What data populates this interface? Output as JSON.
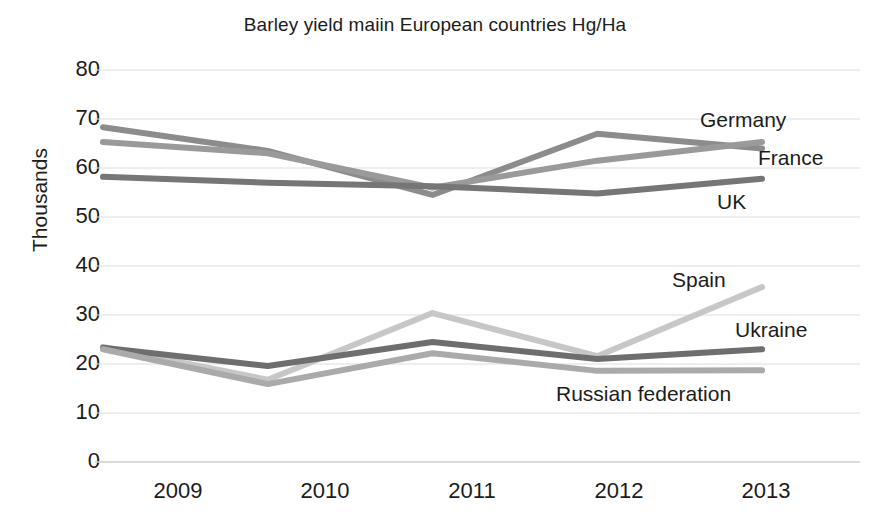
{
  "chart_data": {
    "type": "line",
    "title": "Barley yield maiin European countries Hg/Ha",
    "xlabel": "",
    "ylabel": "Thousands",
    "categories": [
      "2009",
      "2010",
      "2011",
      "2012",
      "2013"
    ],
    "x": [
      2009,
      2010,
      2011,
      2012,
      2013
    ],
    "ylim": [
      0,
      80
    ],
    "ytick_values": [
      0,
      10,
      20,
      30,
      40,
      50,
      60,
      70,
      80
    ],
    "ytick_labels": [
      "0",
      "10",
      "20",
      "30",
      "40",
      "50",
      "60",
      "70",
      "80"
    ],
    "grid": true,
    "legend": "inline-right-end-labels",
    "series": [
      {
        "name": "Germany",
        "values": [
          68.3,
          63.5,
          54.5,
          67.0,
          64.0
        ],
        "color": "#8c8c8c"
      },
      {
        "name": "France",
        "values": [
          65.3,
          63.0,
          56.0,
          61.5,
          65.3
        ],
        "color": "#9a9a9a"
      },
      {
        "name": "UK",
        "values": [
          58.2,
          57.0,
          56.3,
          54.8,
          57.8
        ],
        "color": "#767676"
      },
      {
        "name": "Spain",
        "values": [
          23.5,
          16.8,
          30.4,
          21.6,
          35.7
        ],
        "color": "#c7c7c7"
      },
      {
        "name": "Ukraine",
        "values": [
          23.3,
          19.6,
          24.5,
          21.0,
          23.0
        ],
        "color": "#6e6e6e"
      },
      {
        "name": "Russian federation",
        "values": [
          23.0,
          15.9,
          22.2,
          18.6,
          18.7
        ],
        "color": "#aaaaaa"
      }
    ]
  },
  "axis": {
    "y_tick_0": "0",
    "y_tick_10": "10",
    "y_tick_20": "20",
    "y_tick_30": "30",
    "y_tick_40": "40",
    "y_tick_50": "50",
    "y_tick_60": "60",
    "y_tick_70": "70",
    "y_tick_80": "80",
    "x_tick_0": "2009",
    "x_tick_1": "2010",
    "x_tick_2": "2011",
    "x_tick_3": "2012",
    "x_tick_4": "2013"
  },
  "labels": {
    "germany": "Germany",
    "france": "France",
    "uk": "UK",
    "spain": "Spain",
    "ukraine": "Ukraine",
    "russia": "Russian federation"
  }
}
